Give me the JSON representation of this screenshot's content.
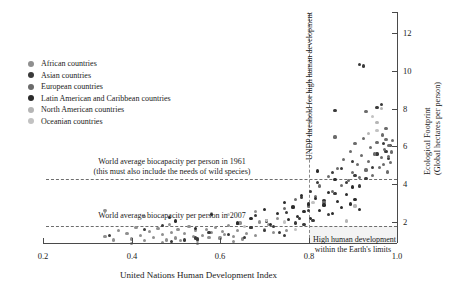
{
  "chart_data": {
    "type": "scatter",
    "title": "",
    "xlabel": "United Nations Human Development Index",
    "ylabel": "Ecological Footprint (Global hectares per person)",
    "xlim": [
      0.2,
      1.0
    ],
    "ylim": [
      0,
      12.6
    ],
    "xticks": [
      0.2,
      0.4,
      0.6,
      0.8,
      1.0
    ],
    "xticklabels": [
      "0.2",
      "0.4",
      "0.6",
      "0.8",
      "1.0"
    ],
    "yticks": [
      2,
      4,
      6,
      8,
      10,
      12
    ],
    "yticklabels": [
      "2",
      "4",
      "6",
      "8",
      "10",
      "12"
    ],
    "y_axis_position": "right",
    "grid": false,
    "legend_position": "upper-left",
    "annotations": [
      {
        "name": "biocapacity-1961",
        "text_line1": "World average biocapacity per person in 1961",
        "text_line2": "(this must also include the needs of wild species)",
        "y_value": 4.3,
        "line_style": "dashed"
      },
      {
        "name": "biocapacity-2007",
        "text_line1": "World average biocapacity per person in 2007",
        "text_line2": "",
        "y_value": 1.8,
        "line_style": "dashed"
      },
      {
        "name": "undp-threshold",
        "text_line1": "UNDP threshold for high human development",
        "x_value": 0.8,
        "orientation": "vertical",
        "line_style": "dashed"
      },
      {
        "name": "sustainable-quadrant",
        "text_line1": "High human development",
        "text_line2": "within the Earth's limits"
      }
    ],
    "series": [
      {
        "name": "African countries",
        "color": "#8f8f8f",
        "points": [
          [
            0.34,
            1.25
          ],
          [
            0.36,
            1.05
          ],
          [
            0.37,
            1.55
          ],
          [
            0.39,
            1.4
          ],
          [
            0.4,
            1.1
          ],
          [
            0.41,
            1.7
          ],
          [
            0.42,
            1.3
          ],
          [
            0.43,
            1.0
          ],
          [
            0.44,
            1.5
          ],
          [
            0.45,
            1.2
          ],
          [
            0.46,
            1.65
          ],
          [
            0.47,
            1.35
          ],
          [
            0.48,
            1.05
          ],
          [
            0.485,
            1.85
          ],
          [
            0.49,
            1.45
          ],
          [
            0.5,
            1.15
          ],
          [
            0.505,
            1.6
          ],
          [
            0.51,
            1.0
          ],
          [
            0.52,
            1.4
          ],
          [
            0.53,
            1.75
          ],
          [
            0.54,
            1.25
          ],
          [
            0.545,
            1.55
          ],
          [
            0.55,
            1.05
          ],
          [
            0.56,
            1.3
          ],
          [
            0.57,
            1.6
          ],
          [
            0.575,
            1.2
          ],
          [
            0.58,
            1.45
          ],
          [
            0.59,
            1.7
          ],
          [
            0.6,
            1.15
          ],
          [
            0.605,
            1.5
          ],
          [
            0.61,
            1.35
          ],
          [
            0.62,
            1.8
          ],
          [
            0.63,
            1.25
          ],
          [
            0.64,
            1.55
          ],
          [
            0.645,
            1.95
          ],
          [
            0.65,
            1.1
          ],
          [
            0.66,
            1.4
          ],
          [
            0.67,
            1.7
          ],
          [
            0.68,
            1.3
          ],
          [
            0.69,
            2.0
          ],
          [
            0.7,
            1.6
          ],
          [
            0.71,
            1.85
          ],
          [
            0.72,
            1.45
          ],
          [
            0.34,
            2.6
          ],
          [
            0.43,
            2.3
          ],
          [
            0.4,
            0.85
          ],
          [
            0.47,
            0.9
          ],
          [
            0.55,
            0.85
          ],
          [
            0.63,
            0.95
          ],
          [
            0.58,
            2.45
          ],
          [
            0.68,
            2.55
          ],
          [
            0.73,
            2.2
          ],
          [
            0.75,
            1.55
          ]
        ]
      },
      {
        "name": "Asian countries",
        "color": "#3a3a3a",
        "points": [
          [
            0.35,
            1.3
          ],
          [
            0.43,
            1.6
          ],
          [
            0.47,
            1.8
          ],
          [
            0.49,
            0.95
          ],
          [
            0.485,
            2.25
          ],
          [
            0.52,
            1.05
          ],
          [
            0.545,
            1.15
          ],
          [
            0.55,
            1.1
          ],
          [
            0.575,
            1.45
          ],
          [
            0.62,
            1.35
          ],
          [
            0.64,
            1.9
          ],
          [
            0.655,
            1.2
          ],
          [
            0.67,
            1.7
          ],
          [
            0.68,
            2.35
          ],
          [
            0.7,
            1.55
          ],
          [
            0.705,
            2.05
          ],
          [
            0.72,
            1.75
          ],
          [
            0.735,
            1.45
          ],
          [
            0.745,
            1.3
          ],
          [
            0.75,
            2.5
          ],
          [
            0.765,
            2.8
          ],
          [
            0.77,
            1.95
          ],
          [
            0.78,
            2.2
          ],
          [
            0.785,
            3.3
          ],
          [
            0.79,
            1.85
          ],
          [
            0.8,
            2.6
          ],
          [
            0.805,
            3.6
          ],
          [
            0.81,
            2.1
          ],
          [
            0.82,
            4.1
          ],
          [
            0.835,
            3.15
          ],
          [
            0.845,
            2.4
          ],
          [
            0.855,
            4.6
          ],
          [
            0.86,
            3.5
          ],
          [
            0.875,
            4.85
          ],
          [
            0.885,
            4.1
          ],
          [
            0.9,
            5.2
          ],
          [
            0.905,
            4.45
          ],
          [
            0.915,
            3.9
          ],
          [
            0.93,
            4.3
          ],
          [
            0.945,
            4.9
          ],
          [
            0.955,
            5.6
          ],
          [
            0.965,
            8.2
          ],
          [
            0.955,
            8.05
          ],
          [
            0.915,
            10.35
          ],
          [
            0.925,
            10.25
          ],
          [
            0.86,
            7.9
          ],
          [
            0.97,
            6.15
          ],
          [
            0.975,
            5.75
          ],
          [
            0.985,
            6.05
          ],
          [
            0.98,
            5.35
          ]
        ]
      },
      {
        "name": "European countries",
        "color": "#6b6b6b",
        "points": [
          [
            0.8,
            2.85
          ],
          [
            0.815,
            3.35
          ],
          [
            0.825,
            3.9
          ],
          [
            0.835,
            3.05
          ],
          [
            0.845,
            4.4
          ],
          [
            0.855,
            3.6
          ],
          [
            0.865,
            4.85
          ],
          [
            0.875,
            3.95
          ],
          [
            0.88,
            5.3
          ],
          [
            0.89,
            4.2
          ],
          [
            0.895,
            5.75
          ],
          [
            0.9,
            4.6
          ],
          [
            0.905,
            6.15
          ],
          [
            0.91,
            5.05
          ],
          [
            0.915,
            4.35
          ],
          [
            0.92,
            5.5
          ],
          [
            0.925,
            6.4
          ],
          [
            0.93,
            4.75
          ],
          [
            0.935,
            5.2
          ],
          [
            0.94,
            5.95
          ],
          [
            0.945,
            4.45
          ],
          [
            0.95,
            5.6
          ],
          [
            0.955,
            6.2
          ],
          [
            0.96,
            4.9
          ],
          [
            0.965,
            5.4
          ],
          [
            0.968,
            6.6
          ],
          [
            0.97,
            5.05
          ],
          [
            0.972,
            5.85
          ],
          [
            0.975,
            6.35
          ],
          [
            0.978,
            4.65
          ],
          [
            0.98,
            5.45
          ],
          [
            0.982,
            6.05
          ],
          [
            0.985,
            5.15
          ],
          [
            0.988,
            5.7
          ],
          [
            0.99,
            6.3
          ],
          [
            0.86,
            6.5
          ],
          [
            0.77,
            3.2
          ],
          [
            0.745,
            2.7
          ],
          [
            0.93,
            7.85
          ],
          [
            0.975,
            6.95
          ]
        ]
      },
      {
        "name": "Latin American and Caribbean countries",
        "color": "#2b2b2b",
        "points": [
          [
            0.58,
            2.4
          ],
          [
            0.64,
            1.95
          ],
          [
            0.67,
            2.2
          ],
          [
            0.7,
            2.65
          ],
          [
            0.715,
            1.85
          ],
          [
            0.73,
            2.45
          ],
          [
            0.745,
            3.05
          ],
          [
            0.755,
            2.15
          ],
          [
            0.765,
            2.75
          ],
          [
            0.775,
            2.3
          ],
          [
            0.785,
            3.4
          ],
          [
            0.79,
            2.55
          ],
          [
            0.8,
            2.95
          ],
          [
            0.805,
            2.2
          ],
          [
            0.815,
            3.25
          ],
          [
            0.825,
            2.6
          ],
          [
            0.835,
            2.9
          ],
          [
            0.845,
            3.55
          ],
          [
            0.855,
            2.45
          ],
          [
            0.865,
            3.1
          ],
          [
            0.875,
            2.75
          ],
          [
            0.885,
            3.45
          ],
          [
            0.895,
            2.95
          ],
          [
            0.905,
            3.2
          ],
          [
            0.915,
            2.65
          ],
          [
            0.82,
            4.7
          ],
          [
            0.86,
            4.25
          ],
          [
            0.9,
            3.85
          ],
          [
            0.5,
            2.05
          ],
          [
            0.545,
            1.65
          ]
        ]
      },
      {
        "name": "North American countries",
        "color": "#b5b5b5",
        "points": [
          [
            0.955,
            7.25
          ],
          [
            0.965,
            8.0
          ],
          [
            0.905,
            2.85
          ],
          [
            0.885,
            2.05
          ],
          [
            0.935,
            6.7
          ]
        ]
      },
      {
        "name": "Oceanian countries",
        "color": "#c2c2c2",
        "points": [
          [
            0.955,
            6.85
          ],
          [
            0.945,
            7.6
          ],
          [
            0.705,
            2.1
          ],
          [
            0.655,
            1.75
          ],
          [
            0.62,
            2.4
          ],
          [
            0.745,
            2.0
          ],
          [
            0.81,
            3.05
          ],
          [
            0.77,
            1.6
          ]
        ]
      }
    ]
  },
  "axis": {
    "x_title": "United Nations Human Development Index",
    "y_title_line1": "Ecological Footprint",
    "y_title_line2": "(Global hectares per person)"
  },
  "legend": {
    "items": [
      {
        "label": "African countries",
        "color": "#8f8f8f"
      },
      {
        "label": "Asian countries",
        "color": "#3a3a3a"
      },
      {
        "label": "European countries",
        "color": "#6b6b6b"
      },
      {
        "label": "Latin American and Caribbean countries",
        "color": "#2b2b2b"
      },
      {
        "label": "North American countries",
        "color": "#b5b5b5"
      },
      {
        "label": "Oceanian countries",
        "color": "#c2c2c2"
      }
    ]
  },
  "annotations": {
    "biocap_1961_line1": "World average biocapacity per person in 1961",
    "biocap_1961_line2": "(this must also include the needs of wild species)",
    "biocap_2007": "World average biocapacity per person in 2007",
    "undp_threshold": "UNDP threshold for high human development",
    "limits_line1": "High human development",
    "limits_line2": "within the Earth's limits"
  }
}
